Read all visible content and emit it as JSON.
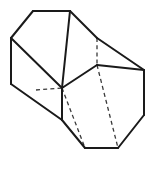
{
  "figure": {
    "shape_name": "hexagonal-prism",
    "projection": "oblique",
    "background_color": "#ffffff",
    "visible_edge_color": "#1a1a1a",
    "hidden_edge_color": "#3a3a3a",
    "visible_stroke_width": 2,
    "hidden_stroke_width": 1.3,
    "hidden_dash_pattern": "4 3.2",
    "canvas": {
      "width": 159,
      "height": 170
    }
  },
  "geometry": {
    "front_hexagon_label": "front-hexagonal-face",
    "back_hexagon_label": "back-hexagonal-face",
    "front_hexagon_points": "62,88 111,148 118,148 144,115 144,70 85,148",
    "back_hexagon_points": "33,11 70,11 97,38 97,65 70,92 33,65",
    "front_face_outline": "36,90 62,88 62,120 85,148 118,148 144,115 144,70 97,65",
    "edges": {
      "visible": [
        {
          "name": "top-back-edge",
          "d": "M 33,11 L 70,11"
        },
        {
          "name": "back-upper-right-edge",
          "d": "M 70,11 L 97,38"
        },
        {
          "name": "back-left-upper-edge",
          "d": "M 33,11 L 11,38"
        },
        {
          "name": "left-long-edge-upper",
          "d": "M 11,38 L 11,84"
        },
        {
          "name": "long-edge-top-to-mid",
          "d": "M 70,11 L 62,88"
        },
        {
          "name": "long-edge-back-left-to-junction",
          "d": "M 11,38 L 62,88"
        },
        {
          "name": "junction-vertical-edge",
          "d": "M 62,88 L 62,120"
        },
        {
          "name": "left-lower-diagonal",
          "d": "M 11,84 L 62,120"
        },
        {
          "name": "bottom-left-diagonal",
          "d": "M 62,120 L 85,148"
        },
        {
          "name": "bottom-front-edge",
          "d": "M 85,148 L 118,148"
        },
        {
          "name": "bottom-right-diagonal",
          "d": "M 118,148 L 144,115"
        },
        {
          "name": "right-long-vertical-edge",
          "d": "M 144,115 L 144,70"
        },
        {
          "name": "right-upper-diagonal",
          "d": "M 144,70 L 97,38"
        },
        {
          "name": "mid-horizontal-edge",
          "d": "M 97,65 L 144,70"
        },
        {
          "name": "junction-to-mid-edge",
          "d": "M 62,88 L 97,65"
        }
      ],
      "hidden": [
        {
          "name": "hidden-vertical-back-edge",
          "d": "M 97,38 L 97,65"
        },
        {
          "name": "hidden-horizontal-left-edge",
          "d": "M 36,90 L 62,88"
        },
        {
          "name": "hidden-long-edge-upper",
          "d": "M 97,65 L 118,148"
        },
        {
          "name": "hidden-long-edge-lower",
          "d": "M 62,88 L 85,148"
        },
        {
          "name": "hidden-front-diagonal",
          "d": "M 85,148 L 118,148"
        }
      ]
    }
  }
}
